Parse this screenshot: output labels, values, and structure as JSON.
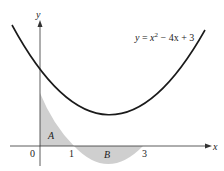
{
  "diagram": {
    "equation_label": "y = x² − 4x + 3",
    "equation_parts": {
      "lhs": "y",
      "eq": " = ",
      "x": "x",
      "exp": "2",
      "rest": " − 4x + 3"
    },
    "axes": {
      "x_label": "x",
      "y_label": "y"
    },
    "ticks": {
      "origin": "0",
      "one": "1",
      "three": "3"
    },
    "regions": {
      "a": "A",
      "b": "B"
    },
    "colors": {
      "curve": "#1a1a1a",
      "shade": "#cfcfcf",
      "axis": "#333333"
    }
  }
}
